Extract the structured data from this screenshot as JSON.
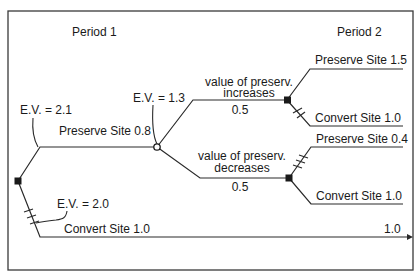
{
  "diagram": {
    "type": "decision-tree",
    "periods": {
      "period1": "Period 1",
      "period2": "Period 2"
    },
    "expected_values": {
      "root_preserve": "E.V. = 2.1",
      "chance_node": "E.V. = 1.3",
      "root_convert": "E.V. = 2.0"
    },
    "branches": {
      "preserve_p1": "Preserve Site 0.8",
      "convert_p1": "Convert Site 1.0",
      "convert_p1_payoff": "1.0",
      "increase_label_line1": "value of preserv.",
      "increase_label_line2": "increases",
      "increase_prob": "0.5",
      "decrease_label_line1": "value of preserv.",
      "decrease_label_line2": "decreases",
      "decrease_prob": "0.5",
      "inc_preserve": "Preserve Site 1.5",
      "inc_convert": "Convert Site 1.0",
      "dec_preserve": "Preserve Site 0.4",
      "dec_convert": "Convert Site 1.0"
    },
    "colors": {
      "line": "#2a2a2a",
      "node_fill": "#1a1a1a",
      "background": "#ffffff"
    }
  }
}
